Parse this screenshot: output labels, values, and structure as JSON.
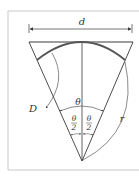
{
  "figure": {
    "labels": {
      "chord_width": "d",
      "arc_length": "D",
      "central_angle": "θ",
      "half_angle_numerator": "θ",
      "half_angle_denominator": "2",
      "radius": "r"
    },
    "colors": {
      "line": "#3a3a3a",
      "frame": "#c8c8c8",
      "arc": "#555555",
      "background": "#ffffff"
    }
  }
}
